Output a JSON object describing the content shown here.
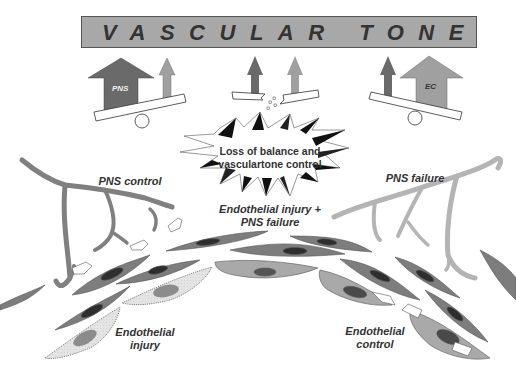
{
  "title": "VASCULAR TONE",
  "balances": [
    {
      "id": "left",
      "big_arrow_label": "PNS",
      "state": "PNS dominant"
    },
    {
      "id": "middle",
      "state": "broken"
    },
    {
      "id": "right",
      "big_arrow_label": "EC",
      "state": "EC dominant"
    }
  ],
  "center": {
    "label_line1": "Loss of balance and",
    "label_line2": "vasculartone control"
  },
  "labels": {
    "pns_control": "PNS control",
    "pns_failure": "PNS failure",
    "endothelial_injury_pns_failure_1": "Endothelial injury +",
    "endothelial_injury_pns_failure_2": "PNS failure",
    "endothelial_injury_1": "Endothelial",
    "endothelial_injury_2": "injury",
    "endothelial_control_1": "Endothelial",
    "endothelial_control_2": "control"
  },
  "colors": {
    "title_bar": "#a8a8a8",
    "pns_arrow": "#6a6a6a",
    "ec_arrow": "#a0a0a0",
    "smooth_muscle_cell": "#7d7d7d",
    "endothelial_cell": "#a9a9a9",
    "injured_endothelial_cell": "#dedede",
    "nerve_control": "#808080",
    "nerve_failure": "#b4b4b4"
  }
}
